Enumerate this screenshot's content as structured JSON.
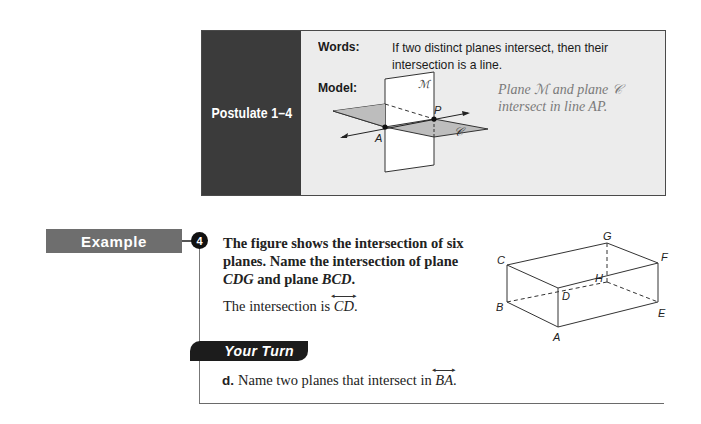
{
  "postulate": {
    "title": "Postulate 1–4",
    "words_label": "Words:",
    "words_text": "If two distinct planes intersect, then their intersection is a line.",
    "model_label": "Model:",
    "caption_line1": "Plane ℳ and plane 𝒞",
    "caption_line2": "intersect in line AP.",
    "figure": {
      "plane_labels": [
        "ℳ",
        "𝒞"
      ],
      "point_labels": [
        "A",
        "P"
      ]
    }
  },
  "example": {
    "tag": "Example",
    "number": "4",
    "question_parts": [
      "The figure shows the intersection of six planes. Name the intersection of plane ",
      "CDG",
      " and plane ",
      "BCD",
      "."
    ],
    "answer_prefix": "The intersection is ",
    "answer_line": "CD",
    "answer_suffix": ".",
    "figure": {
      "vertex_labels": [
        "G",
        "F",
        "C",
        "H",
        "D",
        "B",
        "E",
        "A"
      ]
    }
  },
  "your_turn": {
    "tag": "Your Turn",
    "items": [
      {
        "letter": "d.",
        "text": "Name two planes that intersect in ",
        "line": "BA",
        "suffix": "."
      }
    ]
  },
  "colors": {
    "postulate_side": "#3b3b3b",
    "postulate_bg": "#ececec",
    "example_tag": "#6e6e6e",
    "your_turn_tag": "#1c1c1c",
    "shaded_plane": "#bdbdbd"
  }
}
